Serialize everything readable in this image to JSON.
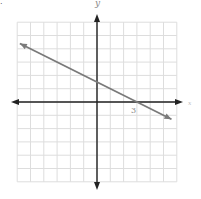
{
  "graph": {
    "labels": {
      "y_axis": "y",
      "x_axis": "x",
      "tick_3": "3",
      "corner_mark": "."
    },
    "grid": {
      "cols": 12,
      "rows": 12,
      "min": -6,
      "max": 6,
      "unit_px": 13.3
    },
    "origin_px": {
      "x": 97,
      "y": 102
    },
    "colors": {
      "grid": "#dddddd",
      "axis": "#222222",
      "line": "#7a7a7a",
      "label": "#888888"
    }
  },
  "chart_data": {
    "type": "line",
    "title": "",
    "xlabel": "x",
    "ylabel": "y",
    "xlim": [
      -6,
      6
    ],
    "ylim": [
      -6,
      6
    ],
    "grid": true,
    "tick_labels": [
      {
        "axis": "x",
        "value": 3,
        "label": "3"
      }
    ],
    "series": [
      {
        "name": "line",
        "equation": "y = -0.5x + 1.5",
        "slope": -0.5,
        "y_intercept": 1.5,
        "x_intercept": 3,
        "x": [
          -5.8,
          0,
          3,
          5.6
        ],
        "y": [
          4.4,
          1.5,
          0,
          -1.3
        ]
      }
    ]
  }
}
